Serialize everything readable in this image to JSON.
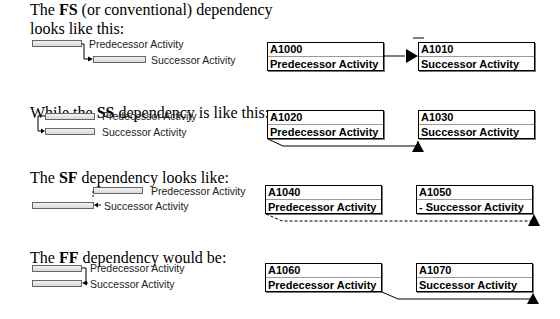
{
  "sections": [
    {
      "type": "FS",
      "caption_pre": "The ",
      "caption_bold": "FS",
      "caption_post": " (or conventional) dependency",
      "caption_line2": "looks like this:",
      "gantt": {
        "predecessor_label": "Predecessor Activity",
        "successor_label": "Successor Activity"
      },
      "network": {
        "predecessor": {
          "id": "A1000",
          "name": "Predecessor Activity"
        },
        "successor": {
          "id": "A1010",
          "name": "Successor Activity"
        }
      }
    },
    {
      "type": "SS",
      "caption_pre": "While the ",
      "caption_bold": "SS",
      "caption_post": " dependency is like this:",
      "gantt": {
        "predecessor_label": "Predecessor Activity",
        "successor_label": "Successor Activity"
      },
      "network": {
        "predecessor": {
          "id": "A1020",
          "name": "Predecessor Activity"
        },
        "successor": {
          "id": "A1030",
          "name": "Successor Activity"
        }
      }
    },
    {
      "type": "SF",
      "caption_pre": "The ",
      "caption_bold": "SF",
      "caption_post": " dependency looks like:",
      "gantt": {
        "predecessor_label": "Predecessor Activity",
        "successor_label": "Successor Activity"
      },
      "network": {
        "predecessor": {
          "id": "A1040",
          "name": "Predecessor Activity"
        },
        "successor": {
          "id": "A1050",
          "name": "- Successor Activity"
        }
      }
    },
    {
      "type": "FF",
      "caption_pre": "The ",
      "caption_bold": "FF",
      "caption_post": " dependency would be:",
      "gantt": {
        "predecessor_label": "Predecessor Activity",
        "successor_label": "Successor Activity"
      },
      "network": {
        "predecessor": {
          "id": "A1060",
          "name": "Predecessor Activity"
        },
        "successor": {
          "id": "A1070",
          "name": "Successor Activity"
        }
      }
    }
  ],
  "colors": {
    "line": "#000000",
    "bar_border": "#666666",
    "bar_fill": "#e6e6e6"
  }
}
